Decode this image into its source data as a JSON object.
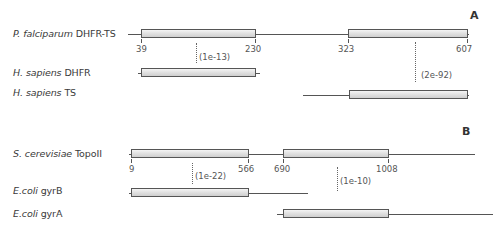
{
  "panels": [
    {
      "letter": "A",
      "rows": [
        {
          "species": "P. falciparum",
          "protein": "DHFR-TS"
        },
        {
          "species": "H. sapiens",
          "protein": "DHFR"
        },
        {
          "species": "H. sapiens",
          "protein": "TS"
        }
      ],
      "positions": [
        "39",
        "230",
        "323",
        "607"
      ],
      "evalues": [
        "(1e-13)",
        "(2e-92)"
      ]
    },
    {
      "letter": "B",
      "rows": [
        {
          "species": "S. cerevisiae",
          "protein": "TopoII"
        },
        {
          "species": "E.coli",
          "protein": "gyrB"
        },
        {
          "species": "E.coli",
          "protein": "gyrA"
        }
      ],
      "positions": [
        "9",
        "566",
        "690",
        "1008"
      ],
      "evalues": [
        "(1e-22)",
        "(1e-10)"
      ]
    }
  ],
  "colors": {
    "line": "#555555",
    "box_top": "#f4f4f4",
    "box_bottom": "#cfcfcf"
  }
}
